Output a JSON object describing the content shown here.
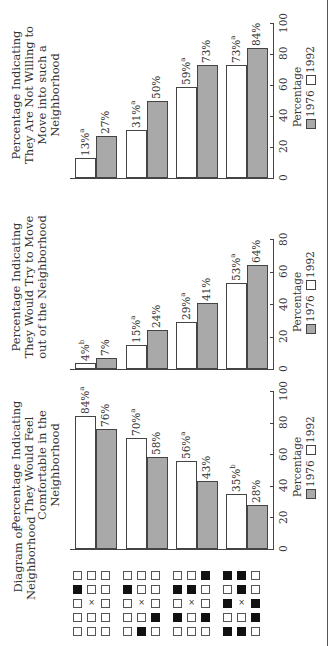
{
  "row_header": "Diagram of Neighborhood",
  "legend": {
    "label": "Percentage",
    "series": [
      {
        "name": "1976",
        "color": "#a9a9a9"
      },
      {
        "name": "1992",
        "color": "#ffffff"
      }
    ]
  },
  "neighborhoods": [
    {
      "id": 1,
      "grid": [
        "....",
        "#...",
        ".x..",
        "....",
        "...."
      ]
    },
    {
      "id": 2,
      "grid": [
        "....",
        "#...",
        ".x..",
        "..#.",
        ".#.."
      ]
    },
    {
      "id": 3,
      "grid": [
        "..#.",
        "##..",
        ".x..",
        "#.#.",
        "...."
      ]
    },
    {
      "id": 4,
      "grid": [
        "##..",
        ".#..",
        "#x#.",
        "..#.",
        "##.."
      ]
    }
  ],
  "chart_data": [
    {
      "type": "bar",
      "title": "Percentage Indicating They Would Feel Comfortable in the Neighborhood",
      "categories": [
        "Neighborhood 1",
        "Neighborhood 2",
        "Neighborhood 3",
        "Neighborhood 4"
      ],
      "series": [
        {
          "name": "1992",
          "values": [
            84,
            70,
            56,
            35
          ],
          "labels": [
            "84%",
            "70%",
            "56%",
            "35%"
          ],
          "superscripts": [
            "a",
            "a",
            "a",
            "b"
          ]
        },
        {
          "name": "1976",
          "values": [
            76,
            58,
            43,
            28
          ],
          "labels": [
            "76%",
            "58%",
            "43%",
            "28%"
          ],
          "superscripts": [
            "",
            "",
            "",
            ""
          ]
        }
      ],
      "xlabel": "Percentage",
      "ticks": [
        "0",
        "20",
        "40",
        "60",
        "80",
        "100"
      ],
      "xlim": [
        0,
        100
      ],
      "grid": false,
      "legend_position": "bottom"
    },
    {
      "type": "bar",
      "title": "Percentage Indicating They Would Try to Move out of the Neighborhood",
      "categories": [
        "Neighborhood 1",
        "Neighborhood 2",
        "Neighborhood 3",
        "Neighborhood 4"
      ],
      "series": [
        {
          "name": "1992",
          "values": [
            4,
            15,
            29,
            53
          ],
          "labels": [
            "4%",
            "15%",
            "29%",
            "53%"
          ],
          "superscripts": [
            "b",
            "a",
            "a",
            "a"
          ]
        },
        {
          "name": "1976",
          "values": [
            7,
            24,
            41,
            64
          ],
          "labels": [
            "7%",
            "24%",
            "41%",
            "64%"
          ],
          "superscripts": [
            "",
            "",
            "",
            ""
          ]
        }
      ],
      "xlabel": "Percentage",
      "ticks": [
        "0",
        "20",
        "40",
        "60",
        "80"
      ],
      "xlim": [
        0,
        80
      ],
      "grid": false,
      "legend_position": "bottom"
    },
    {
      "type": "bar",
      "title": "Percentage Indicating They Are Not Willing to Move into such a Neighborhood",
      "categories": [
        "Neighborhood 1",
        "Neighborhood 2",
        "Neighborhood 3",
        "Neighborhood 4"
      ],
      "series": [
        {
          "name": "1992",
          "values": [
            13,
            31,
            59,
            73
          ],
          "labels": [
            "13%",
            "31%",
            "59%",
            "73%"
          ],
          "superscripts": [
            "a",
            "a",
            "a",
            "a"
          ]
        },
        {
          "name": "1976",
          "values": [
            27,
            50,
            73,
            84
          ],
          "labels": [
            "27%",
            "50%",
            "73%",
            "84%"
          ],
          "superscripts": [
            "",
            "",
            "",
            ""
          ]
        }
      ],
      "xlabel": "Percentage",
      "ticks": [
        "0",
        "20",
        "40",
        "60",
        "80",
        "100"
      ],
      "xlim": [
        0,
        100
      ],
      "grid": false,
      "legend_position": "bottom"
    }
  ]
}
